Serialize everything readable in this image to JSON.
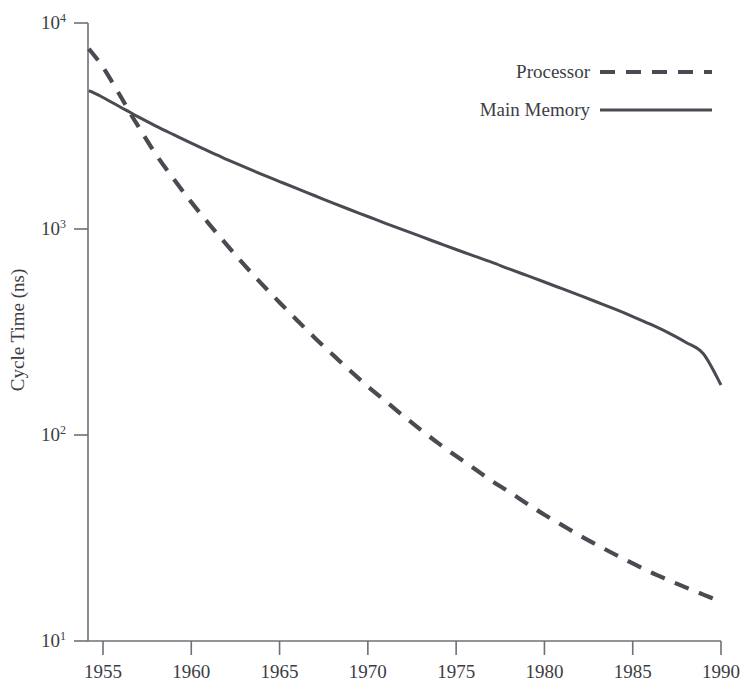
{
  "chart_data": {
    "type": "line",
    "title": "",
    "xlabel": "",
    "ylabel": "Cycle Time (ns)",
    "yscale": "log",
    "xlim": [
      1954.2,
      1990
    ],
    "ylim": [
      10,
      10000
    ],
    "grid": false,
    "legend_position": "top-right",
    "xticks": [
      1955,
      1960,
      1965,
      1970,
      1975,
      1980,
      1985,
      1990
    ],
    "xtick_labels": [
      "1955",
      "1960",
      "1965",
      "1970",
      "1975",
      "1980",
      "1985",
      "1990"
    ],
    "yticks": [
      10000,
      1000,
      100,
      10
    ],
    "ytick_labels": [
      "10⁴",
      "10³",
      "10²",
      "10¹"
    ],
    "ytick_mantissa": [
      "10",
      "10",
      "10",
      "10"
    ],
    "ytick_exponent": [
      "4",
      "3",
      "2",
      "1"
    ],
    "series": [
      {
        "name": "Processor",
        "style": "dashed",
        "color": "#4a4a52",
        "x": [
          1954.2,
          1955,
          1956,
          1956.5,
          1957,
          1958,
          1959,
          1960,
          1961,
          1962,
          1963,
          1964,
          1965,
          1966,
          1967,
          1968,
          1969,
          1970,
          1971,
          1972,
          1973,
          1974,
          1975,
          1976,
          1977,
          1978,
          1979,
          1980,
          1981,
          1982,
          1983,
          1984,
          1985,
          1986,
          1987,
          1988,
          1989,
          1990
        ],
        "y": [
          7500,
          6100,
          4400,
          3700,
          3150,
          2300,
          1750,
          1350,
          1060,
          840,
          670,
          540,
          440,
          360,
          296,
          246,
          205,
          172,
          146,
          124,
          106,
          91,
          79,
          69,
          60,
          53,
          46.5,
          41,
          36.5,
          32.5,
          29.2,
          26.3,
          23.8,
          21.6,
          19.8,
          18.2,
          16.8,
          15.5
        ]
      },
      {
        "name": "Main Memory",
        "style": "solid",
        "color": "#4a4a52",
        "x": [
          1954.2,
          1955,
          1956,
          1956.5,
          1957,
          1958,
          1959,
          1960,
          1961,
          1962,
          1963,
          1964,
          1965,
          1966,
          1967,
          1968,
          1969,
          1970,
          1971,
          1972,
          1973,
          1974,
          1975,
          1976,
          1977,
          1978,
          1979,
          1980,
          1981,
          1982,
          1983,
          1984,
          1985,
          1986,
          1987,
          1988,
          1989,
          1990
        ],
        "y": [
          4700,
          4350,
          3900,
          3700,
          3500,
          3160,
          2870,
          2610,
          2380,
          2180,
          2000,
          1840,
          1700,
          1570,
          1450,
          1340,
          1240,
          1150,
          1065,
          990,
          920,
          855,
          795,
          740,
          690,
          640,
          595,
          553,
          513,
          476,
          441,
          408,
          376,
          345,
          314,
          282,
          248,
          175
        ]
      }
    ],
    "annotations": {
      "crossover_year": 1956.5,
      "crossover_value": 3700
    }
  },
  "legend": {
    "entries": [
      {
        "label": "Processor",
        "style": "dashed"
      },
      {
        "label": "Main Memory",
        "style": "solid"
      }
    ]
  },
  "colors": {
    "line": "#4a4a52",
    "axis": "#6f6f78",
    "text": "#3d3d44",
    "background": "#ffffff"
  }
}
